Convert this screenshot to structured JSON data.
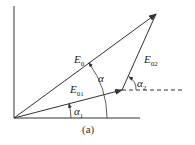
{
  "diagram": {
    "caption": "(a)",
    "vectors": [
      {
        "name": "E0",
        "base": "E",
        "sub": "0"
      },
      {
        "name": "E01",
        "base": "E",
        "sub": "01"
      },
      {
        "name": "E02",
        "base": "E",
        "sub": "02"
      }
    ],
    "angles": [
      {
        "name": "alpha",
        "symbol": "α",
        "sub": ""
      },
      {
        "name": "alpha1",
        "symbol": "α",
        "sub": "1"
      },
      {
        "name": "alpha2",
        "symbol": "α",
        "sub": "2"
      }
    ],
    "colors": {
      "line": "#333333",
      "background": "#ffffff"
    }
  }
}
